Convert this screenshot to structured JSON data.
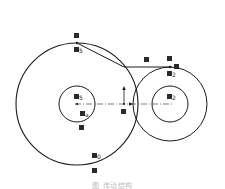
{
  "figure": {
    "caption": "图 传动结构",
    "colors": {
      "stroke": "#1a1a1a",
      "label_box": "#2a2a2a",
      "caption": "#bbbbbb"
    }
  },
  "labels": {
    "top_left_point": "",
    "top_left_sub": "5",
    "inner_left": "5",
    "inner_left_low": "a",
    "inner_left_low2": "",
    "center_mid": "",
    "belt_mid": "",
    "top_right_point": "",
    "top_right_end": "",
    "top_right_sub": "2",
    "inner_right": "2",
    "bottom_left": "0",
    "bottom_left2": ""
  },
  "geometry": {
    "large_circle": {
      "cx": 77,
      "cy": 104,
      "r": 61
    },
    "left_inner_circle": {
      "cx": 77,
      "cy": 104,
      "r": 18
    },
    "right_outer_circle": {
      "cx": 170,
      "cy": 104,
      "r": 37
    },
    "right_inner_circle": {
      "cx": 170,
      "cy": 104,
      "r": 18
    }
  }
}
